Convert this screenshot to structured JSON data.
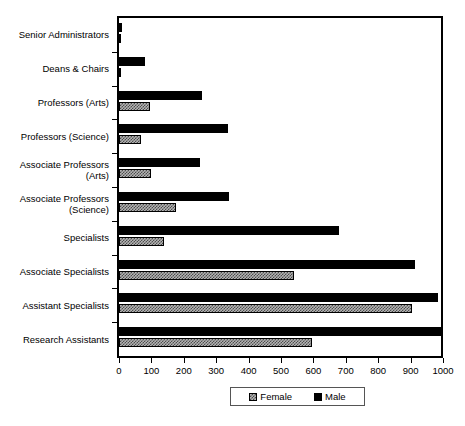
{
  "chart_data": {
    "type": "bar",
    "orientation": "horizontal",
    "title": "",
    "xlabel": "",
    "ylabel": "",
    "xlim": [
      0,
      1000
    ],
    "xticks": [
      0,
      100,
      200,
      300,
      400,
      500,
      600,
      700,
      800,
      900,
      1000
    ],
    "grid": false,
    "legend_position": "bottom",
    "categories": [
      "Senior Administrators",
      "Deans & Chairs",
      "Professors (Arts)",
      "Professors (Science)",
      "Associate Professors\n(Arts)",
      "Associate Professors\n(Science)",
      "Specialists",
      "Associate Specialists",
      "Assistant Specialists",
      "Research Assistants"
    ],
    "series": [
      {
        "name": "Male",
        "color": "#000000",
        "pattern": "solid",
        "values": [
          10,
          80,
          255,
          335,
          250,
          340,
          680,
          915,
          985,
          1000
        ]
      },
      {
        "name": "Female",
        "color": "#b3b3b3",
        "pattern": "checkered",
        "values": [
          2,
          5,
          95,
          68,
          98,
          175,
          140,
          540,
          905,
          595
        ]
      }
    ]
  },
  "legend": {
    "entries": [
      {
        "label": "Female"
      },
      {
        "label": "Male"
      }
    ]
  }
}
